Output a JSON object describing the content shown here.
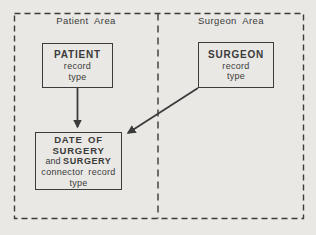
{
  "colors": {
    "ink": "#3b3b3b",
    "paper": "#e9e8e4"
  },
  "patient_area": {
    "label": "Patient Area"
  },
  "surgeon_area": {
    "label": "Surgeon Area"
  },
  "patient_box": {
    "title": "PATIENT",
    "line2": "record",
    "line3": "type"
  },
  "surgeon_box": {
    "title": "SURGEON",
    "line2": "record",
    "line3": "type"
  },
  "connector_box": {
    "line1": "DATE OF",
    "line2": "SURGERY",
    "line3a": "and",
    "line3b": "SURGERY",
    "line4": "connector record",
    "line5": "type"
  }
}
